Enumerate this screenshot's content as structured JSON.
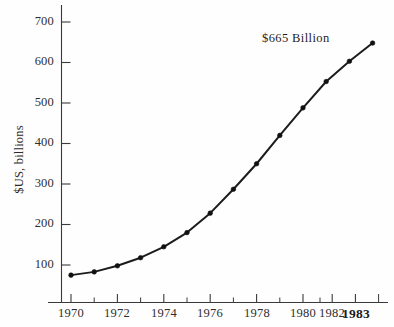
{
  "chart_data": {
    "type": "line",
    "title": "",
    "subtitle": "",
    "xlabel": "",
    "ylabel": "$US, billions",
    "x": [
      1970,
      1971,
      1972,
      1973,
      1974,
      1975,
      1976,
      1977,
      1978,
      1979,
      1980,
      1981,
      1982,
      1983
    ],
    "values": [
      75,
      83,
      98,
      118,
      145,
      180,
      228,
      287,
      350,
      420,
      488,
      553,
      603,
      648
    ],
    "series": [
      {
        "name": "$US, billions",
        "values": [
          75,
          83,
          98,
          118,
          145,
          180,
          228,
          287,
          350,
          420,
          488,
          553,
          603,
          648
        ]
      }
    ],
    "xlim": [
      1969.3,
      1984.2
    ],
    "ylim": [
      0,
      740
    ],
    "ytick_labels": [
      "700",
      "600",
      "500",
      "400",
      "300",
      "200",
      "100"
    ],
    "ytick_values": [
      700,
      600,
      500,
      400,
      300,
      200,
      100
    ],
    "xtick_labels": [
      "1970",
      "1972",
      "1974",
      "1976",
      "1978",
      "1980",
      "1982",
      "1983"
    ],
    "xtick_values": [
      1970,
      1972,
      1974,
      1976,
      1978,
      1980,
      1982,
      1983
    ],
    "xtick_minor_values": [
      1971,
      1973,
      1975,
      1977,
      1979,
      1981,
      1984
    ],
    "grid": false,
    "legend": "none",
    "markers": true,
    "annotations": [
      {
        "text": "$665 Billion",
        "x": 1983,
        "y": 665
      }
    ],
    "colors": {
      "line": "#1c1c1c",
      "marker": "#111111",
      "axis": "#3a3a3a",
      "text": "#2b2b2b",
      "background": "#fefefe"
    }
  },
  "annotation": {
    "value_label": "$665 Billion"
  },
  "axes": {
    "y_title": "$US, billions"
  }
}
